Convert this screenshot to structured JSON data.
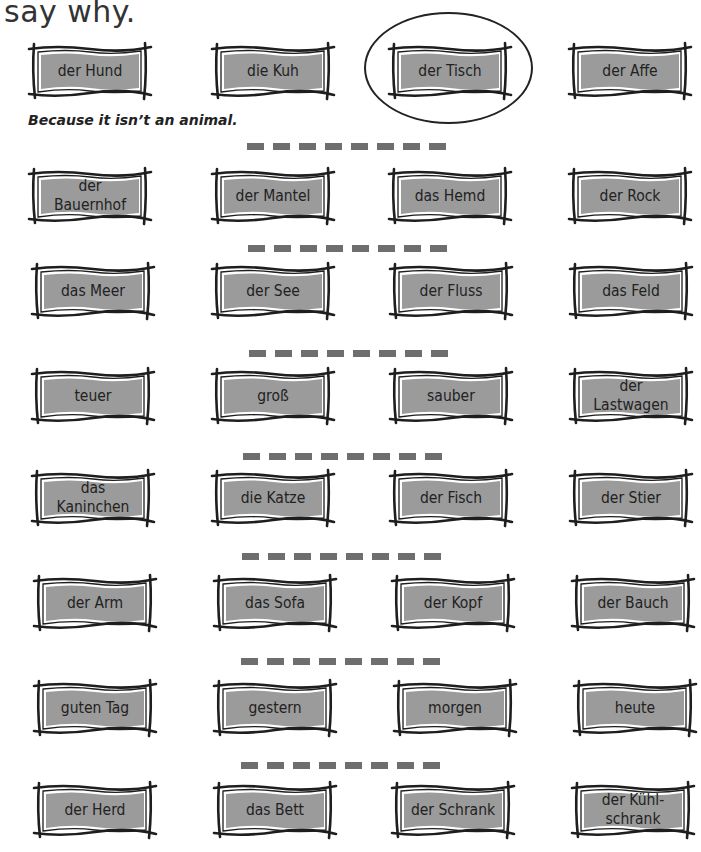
{
  "title": "say why.",
  "example_answer": "Because it isn’t an animal.",
  "colors": {
    "card_fill": "#9b9b9b",
    "card_border": "#1e1e1e",
    "dash": "#6e6e6e"
  },
  "rows": [
    {
      "words": [
        "der Hund",
        "die Kuh",
        "der Tisch",
        "der Affe"
      ],
      "circled_index": 2
    },
    {
      "words": [
        "der\nBauernhof",
        "der Mantel",
        "das Hemd",
        "der Rock"
      ]
    },
    {
      "words": [
        "das Meer",
        "der See",
        "der Fluss",
        "das Feld"
      ]
    },
    {
      "words": [
        "teuer",
        "groß",
        "sauber",
        "der\nLastwagen"
      ]
    },
    {
      "words": [
        "das\nKaninchen",
        "die Katze",
        "der Fisch",
        "der Stier"
      ]
    },
    {
      "words": [
        "der Arm",
        "das Sofa",
        "der Kopf",
        "der Bauch"
      ]
    },
    {
      "words": [
        "guten Tag",
        "gestern",
        "morgen",
        "heute"
      ]
    },
    {
      "words": [
        "der Herd",
        "das Bett",
        "der Schrank",
        "der Kühl-\nschrank"
      ]
    }
  ],
  "answer_line_icon": "dashed-write-line",
  "card_icon": "sketch-frame"
}
